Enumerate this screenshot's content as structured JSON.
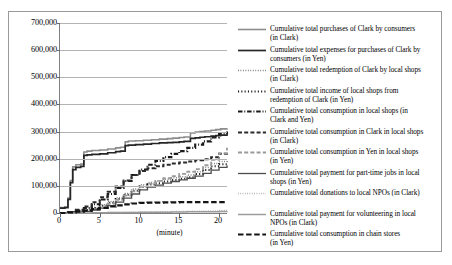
{
  "chart_data": {
    "type": "line",
    "title": "",
    "xlabel": "(minute)",
    "ylabel": "",
    "xlim": [
      0,
      21
    ],
    "ylim": [
      0,
      700000
    ],
    "grid": true,
    "legend_position": "right",
    "y_ticks": [
      "0",
      "100,000",
      "200,000",
      "300,000",
      "400,000",
      "500,000",
      "600,000",
      "700,000"
    ],
    "y_tick_values": [
      0,
      100000,
      200000,
      300000,
      400000,
      500000,
      600000,
      700000
    ],
    "x_ticks": [
      "0",
      "5",
      "10",
      "15",
      "20"
    ],
    "x_tick_values": [
      0,
      5,
      10,
      15,
      20
    ],
    "series": [
      {
        "name": "Cumulative total purchases of Clark by consumers\n(in Clark)",
        "style": "solid",
        "color": "#8c8c8c",
        "width": 1.6,
        "x": [
          0,
          0.6,
          1.0,
          1.3,
          1.6,
          2.0,
          2.6,
          3.0,
          3.4,
          4.0,
          5.0,
          6.0,
          7.0,
          7.6,
          8.2,
          8.6,
          9.5,
          10.5,
          11.5,
          12.5,
          13.5,
          14.2,
          15.0,
          15.6,
          16.4,
          17.0,
          17.6,
          18.2,
          19.0,
          19.6,
          20.2,
          21
        ],
        "y": [
          20000,
          22000,
          55000,
          120000,
          170000,
          178000,
          180000,
          225000,
          228000,
          230000,
          232000,
          236000,
          240000,
          242000,
          262000,
          265000,
          266000,
          268000,
          270000,
          272000,
          274000,
          276000,
          278000,
          280000,
          295000,
          298000,
          300000,
          302000,
          305000,
          307000,
          310000,
          312000
        ]
      },
      {
        "name": "Cumulative total expenses for purchases of Clark by\nconsumers (in Yen)",
        "style": "solid",
        "color": "#262626",
        "width": 1.7,
        "x": [
          0,
          0.6,
          1.0,
          1.3,
          1.6,
          2.0,
          2.6,
          3.0,
          3.4,
          4.0,
          5.0,
          6.0,
          7.0,
          7.6,
          8.2,
          8.6,
          9.5,
          10.5,
          11.5,
          12.5,
          13.5,
          14.2,
          15.0,
          15.6,
          16.4,
          17.0,
          17.6,
          18.2,
          19.0,
          19.6,
          20.2,
          21
        ],
        "y": [
          18000,
          20000,
          50000,
          112000,
          160000,
          168000,
          172000,
          212000,
          214000,
          216000,
          218000,
          222000,
          226000,
          228000,
          248000,
          250000,
          252000,
          254000,
          256000,
          258000,
          259000,
          260000,
          262000,
          264000,
          275000,
          277000,
          279000,
          281000,
          283000,
          285000,
          287000,
          289000
        ]
      },
      {
        "name": "Cumulative total redemption of Clark by local shops\n(in Clark)",
        "style": "dotted",
        "color": "#6e6e6e",
        "width": 1.5,
        "x": [
          0,
          1,
          2,
          3,
          4,
          5,
          6,
          7,
          8,
          9,
          10,
          11,
          12,
          13,
          14,
          15,
          16,
          17,
          18,
          19,
          20,
          21
        ],
        "y": [
          0,
          2000,
          6000,
          12000,
          20000,
          30000,
          42000,
          56000,
          72000,
          88000,
          104000,
          112000,
          118000,
          124000,
          130000,
          134000,
          140000,
          152000,
          168000,
          182000,
          190000,
          196000
        ]
      },
      {
        "name": "Cumulative total income of local shops from\nredemption of Clark (in Yen)",
        "style": "dotted",
        "color": "#1a1a1a",
        "width": 2.0,
        "x": [
          0,
          1,
          2,
          3,
          4,
          5,
          6,
          7,
          8,
          9,
          10,
          11,
          12,
          13,
          14,
          15,
          16,
          17,
          18,
          19,
          20,
          21
        ],
        "y": [
          0,
          1500,
          5000,
          10000,
          18000,
          27000,
          38000,
          52000,
          67000,
          82000,
          97000,
          105000,
          110000,
          116000,
          122000,
          126000,
          132000,
          144000,
          158000,
          172000,
          180000,
          186000
        ]
      },
      {
        "name": "Cumulative total consumption in local shops (in\nClark and Yen)",
        "style": "dashdot",
        "color": "#1a1a1a",
        "width": 2.1,
        "x": [
          0,
          1,
          2,
          3,
          4,
          5,
          6,
          7,
          8,
          9,
          10,
          11,
          12,
          13,
          14,
          15,
          16,
          17,
          18,
          19,
          20,
          21
        ],
        "y": [
          0,
          3000,
          9000,
          18000,
          32000,
          50000,
          70000,
          92000,
          118000,
          140000,
          160000,
          178000,
          192000,
          206000,
          218000,
          228000,
          240000,
          252000,
          264000,
          278000,
          292000,
          300000
        ]
      },
      {
        "name": "Cumulative total consumption in Clark in local shops\n(in Clark)",
        "style": "dashed",
        "color": "#2b2b2b",
        "width": 2.0,
        "x": [
          0,
          1,
          2,
          3,
          4,
          5,
          6,
          7,
          8,
          9,
          10,
          11,
          12,
          13,
          14,
          15,
          16,
          17,
          18,
          19,
          20,
          21
        ],
        "y": [
          0,
          4000,
          12000,
          24000,
          40000,
          58000,
          78000,
          98000,
          120000,
          140000,
          155000,
          165000,
          172000,
          178000,
          182000,
          186000,
          190000,
          194000,
          198000,
          205000,
          218000,
          228000
        ]
      },
      {
        "name": "Cumulative total consumption in Yen in local shops\n(in Yen)",
        "style": "dashed",
        "color": "#9a9a9a",
        "width": 1.8,
        "x": [
          0,
          1,
          2,
          3,
          4,
          5,
          6,
          7,
          8,
          9,
          10,
          11,
          12,
          13,
          14,
          15,
          16,
          17,
          18,
          19,
          20,
          21
        ],
        "y": [
          0,
          1000,
          3000,
          7000,
          13000,
          22000,
          34000,
          48000,
          64000,
          80000,
          96000,
          108000,
          118000,
          128000,
          136000,
          144000,
          152000,
          162000,
          176000,
          196000,
          220000,
          240000
        ]
      },
      {
        "name": "Cumulative total payment for part-time jobs in local\nshops (in Yen)",
        "style": "solid",
        "color": "#4d4d4d",
        "width": 1.3,
        "x": [
          0,
          1,
          2,
          3,
          4,
          5,
          6,
          7,
          8,
          9,
          10,
          11,
          12,
          13,
          14,
          15,
          16,
          17,
          18,
          19,
          20,
          21
        ],
        "y": [
          0,
          1000,
          3000,
          6000,
          11000,
          18000,
          27000,
          40000,
          55000,
          70000,
          85000,
          95000,
          103000,
          110000,
          116000,
          122000,
          128000,
          136000,
          146000,
          158000,
          168000,
          176000
        ]
      },
      {
        "name": "Cumulative total donations to local NPOs (in Clark)",
        "style": "dotted",
        "color": "#a8a8a8",
        "width": 1.4,
        "x": [
          0,
          2,
          4,
          6,
          8,
          10,
          12,
          14,
          16,
          18,
          20,
          21
        ],
        "y": [
          0,
          500,
          1200,
          2000,
          3000,
          4000,
          5000,
          6000,
          7000,
          8000,
          9000,
          9500
        ]
      },
      {
        "name": "Cumulative total payment for volunteering in local\nNPOs (in Clark)",
        "style": "solid",
        "color": "#9c9c9c",
        "width": 1.5,
        "x": [
          0,
          2,
          4,
          6,
          8,
          10,
          12,
          14,
          16,
          18,
          20,
          21
        ],
        "y": [
          0,
          300,
          800,
          1400,
          2000,
          2600,
          3200,
          3800,
          4400,
          5000,
          5600,
          6000
        ]
      },
      {
        "name": "Cumulative total consumption in chain stores\n(in Yen)",
        "style": "longdash",
        "color": "#141414",
        "width": 2.2,
        "x": [
          0,
          1,
          2,
          3,
          4,
          5,
          6,
          7,
          8,
          9,
          10,
          11,
          12,
          13,
          14,
          15,
          16,
          17,
          18,
          19,
          20,
          21
        ],
        "y": [
          0,
          2000,
          5000,
          9000,
          14000,
          19000,
          24000,
          28000,
          32000,
          35000,
          37000,
          38000,
          38500,
          39000,
          39500,
          40000,
          40000,
          40000,
          40000,
          40000,
          40000,
          40000
        ]
      }
    ]
  }
}
